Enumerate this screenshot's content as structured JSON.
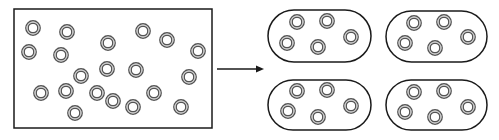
{
  "diagram": {
    "colors": {
      "stroke": "#1a1a1a",
      "ring": "#555555",
      "background": "#ffffff"
    },
    "source_container": {
      "x": 14,
      "y": 9,
      "width": 198,
      "height": 119,
      "particles": [
        [
          33,
          28
        ],
        [
          67,
          32
        ],
        [
          108,
          43
        ],
        [
          143,
          31
        ],
        [
          167,
          40
        ],
        [
          198,
          51
        ],
        [
          29,
          52
        ],
        [
          61,
          55
        ],
        [
          81,
          76
        ],
        [
          107,
          69
        ],
        [
          136,
          70
        ],
        [
          189,
          77
        ],
        [
          41,
          93
        ],
        [
          66,
          91
        ],
        [
          97,
          93
        ],
        [
          113,
          101
        ],
        [
          133,
          107
        ],
        [
          154,
          93
        ],
        [
          181,
          107
        ],
        [
          75,
          113
        ]
      ]
    },
    "arrow": {
      "x1": 217,
      "y1": 69,
      "x2": 264,
      "y2": 69
    },
    "groups": [
      {
        "x": 268,
        "y": 10,
        "width": 103,
        "height": 52,
        "particles": [
          [
            297,
            22
          ],
          [
            327,
            21
          ],
          [
            351,
            37
          ],
          [
            287,
            43
          ],
          [
            318,
            47
          ]
        ]
      },
      {
        "x": 386,
        "y": 11,
        "width": 101,
        "height": 51,
        "particles": [
          [
            414,
            23
          ],
          [
            444,
            22
          ],
          [
            468,
            37
          ],
          [
            405,
            43
          ],
          [
            435,
            48
          ]
        ]
      },
      {
        "x": 268,
        "y": 80,
        "width": 103,
        "height": 50,
        "particles": [
          [
            297,
            91
          ],
          [
            327,
            90
          ],
          [
            351,
            106
          ],
          [
            288,
            111
          ],
          [
            318,
            117
          ]
        ]
      },
      {
        "x": 386,
        "y": 80,
        "width": 101,
        "height": 50,
        "particles": [
          [
            414,
            92
          ],
          [
            444,
            91
          ],
          [
            468,
            107
          ],
          [
            405,
            112
          ],
          [
            435,
            117
          ]
        ]
      }
    ]
  }
}
